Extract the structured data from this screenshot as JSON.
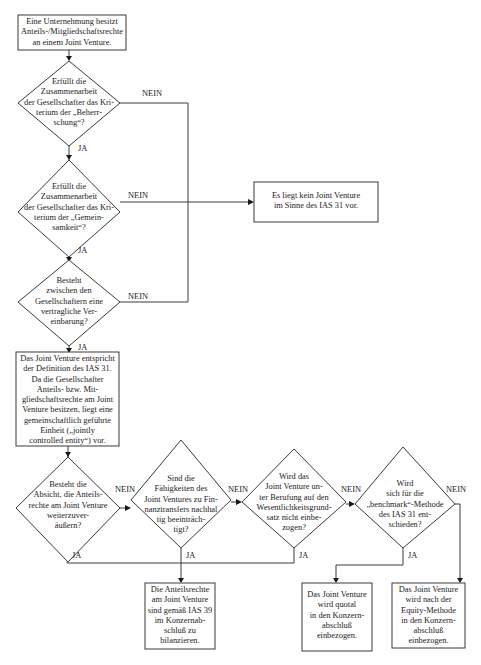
{
  "diagram": {
    "type": "flowchart",
    "language": "de",
    "start": {
      "text": "Eine Unternehmung besitzt\nAnteils-/Mitgliedschaftsrechte\nan einem Joint Venture."
    },
    "decisions": [
      {
        "id": "d1",
        "text": "Erfüllt die\nZusammenarbeit\nder Gesellschafter das Kri-\nterium der „Beherr-\nschung“?",
        "yes": "JA",
        "no": "NEIN"
      },
      {
        "id": "d2",
        "text": "Erfüllt die\nZusammenarbeit\nder Gesellschafter das Kri-\nterium der „Gemein-\nsamkeit“?",
        "yes": "JA",
        "no": "NEIN"
      },
      {
        "id": "d3",
        "text": "Besteht\nzwischen den\nGesellschaftern eine\nvertragliche Ver-\neinbarung?",
        "yes": "JA",
        "no": "NEIN"
      },
      {
        "id": "d4",
        "text": "Besteht die\nAbsicht, die Anteils-\nrechte am Joint Venture\nweiterzuver-\näußern?",
        "yes": "JA",
        "no": "NEIN"
      },
      {
        "id": "d5",
        "text": "Sind die\nFähigkeiten des\nJoint Ventures zu Fin-\nnanztransfers nachhal\ntig beeinträch-\ntigt?",
        "yes": "JA",
        "no": "NEIN"
      },
      {
        "id": "d6",
        "text": "Wird das\nJoint Venture un-\nter Berufung auf den\nWesentlichkeitsgrund-\nsatz nicht einbe-\nzogen?",
        "yes": "JA",
        "no": "NEIN"
      },
      {
        "id": "d7",
        "text": "Wird\nsich für die\n„benchmark“-Methode\ndes IAS 31 ent-\nschieden?",
        "yes": "JA",
        "no": "NEIN"
      }
    ],
    "results": {
      "no_jv": "Es liegt kein Joint Venture\nim Sinne des IAS 31 vor.",
      "definition": "Das Joint Venture entspricht\nder Definition des IAS 31.\nDa die Gesellschafter\nAnteils- bzw. Mit-\ngliedschaftsrechte am Joint\nVenture besitzen, liegt eine\ngemeinschaftlich geführte\nEinheit („jointly\ncontrolled entity“) vor.",
      "ias39": "Die Anteilsrechte\nam Joint Venture\nsind gemäß IAS 39\nim Konzernab-\nschluß zu\nbilanzieren.",
      "quotal": "Das Joint Venture\nwird quotal\nin den Konzern-\nabschluß\neinbezogen.",
      "equity": "Das Joint Venture\nwird nach der\nEquity-Methode\nin den Konzern-\nabschluß\neinbezogen."
    },
    "colors": {
      "line": "#3a3a3a",
      "arrow": "#1a1a1a",
      "text": "#222222",
      "background": "#ffffff"
    }
  }
}
